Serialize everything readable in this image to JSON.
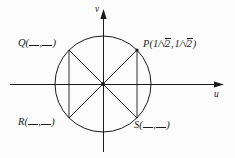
{
  "figure": {
    "type": "unit-circle-diagram",
    "background_color": "#fcfcfc",
    "stroke_color": "#1a1a1a",
    "axes": {
      "horizontal_label": "u",
      "vertical_label": "v",
      "origin": {
        "x": 103,
        "y": 84
      }
    },
    "circle": {
      "center_x": 103,
      "center_y": 84,
      "radius": 48
    },
    "points": [
      {
        "id": "P",
        "name": "P",
        "label": "P(1/√2, 1/√2)",
        "coord_x_text": "1/√2",
        "coord_y_text": "1/√2",
        "filled": true,
        "angle_deg": 45,
        "position": {
          "x": 137,
          "y": 50
        }
      },
      {
        "id": "Q",
        "name": "Q",
        "label": "Q(__, __)",
        "coord_x_text": "__",
        "coord_y_text": "__",
        "filled": false,
        "angle_deg": 135,
        "position": {
          "x": 69,
          "y": 50
        }
      },
      {
        "id": "R",
        "name": "R",
        "label": "R(__, __)",
        "coord_x_text": "__",
        "coord_y_text": "__",
        "filled": false,
        "angle_deg": 225,
        "position": {
          "x": 69,
          "y": 118
        }
      },
      {
        "id": "S",
        "name": "S",
        "label": "S(__, __)",
        "coord_x_text": "__",
        "coord_y_text": "__",
        "filled": false,
        "angle_deg": 315,
        "position": {
          "x": 137,
          "y": 118
        }
      }
    ],
    "chords": [
      {
        "name": "diagonal-q-s",
        "from": "Q",
        "to": "S"
      },
      {
        "name": "diagonal-p-r",
        "from": "P",
        "to": "R"
      },
      {
        "name": "vertical-chord-left",
        "from": "Q",
        "to": "R"
      },
      {
        "name": "vertical-chord-right",
        "from": "P",
        "to": "S"
      }
    ],
    "labels": {
      "p_prefix": "P",
      "q_prefix": "Q",
      "r_prefix": "R",
      "s_prefix": "S",
      "open_paren": "(",
      "close_paren": ")",
      "comma": ",",
      "one": "1",
      "slash": "/",
      "radical_sign": "√",
      "radicand": "2"
    }
  }
}
